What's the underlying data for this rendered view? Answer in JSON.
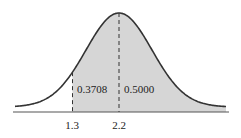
{
  "chart_data": {
    "type": "area",
    "title": "",
    "xlabel": "",
    "ylabel": "",
    "distribution": "normal",
    "mean": 2.2,
    "grid": false,
    "legend": null,
    "shaded_region": {
      "from": 1.3,
      "to": "+inf"
    },
    "x_ticks": [
      "1.3",
      "2.2"
    ],
    "markers": [
      {
        "x": 1.3,
        "style": "dashed"
      },
      {
        "x": 2.2,
        "style": "dashed"
      }
    ],
    "annotations": [
      {
        "text": "0.3708",
        "region": "between 1.3 and 2.2",
        "value": 0.3708
      },
      {
        "text": "0.5000",
        "region": "right of 2.2",
        "value": 0.5
      }
    ],
    "colors": {
      "curve": "#333333",
      "shade": "#d6d6d6",
      "axis": "#555555"
    }
  },
  "labels": {
    "tick_left": "1.3",
    "tick_mean": "2.2",
    "area_left": "0.3708",
    "area_right": "0.5000"
  }
}
